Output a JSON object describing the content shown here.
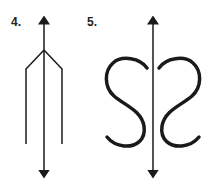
{
  "figures": [
    {
      "label": "4.",
      "description": "trident-shaped figure with vertical axis of symmetry (double-headed arrow)"
    },
    {
      "label": "5.",
      "description": "two mirrored S-curves with vertical axis of symmetry (double-headed arrow)"
    }
  ],
  "colors": {
    "stroke": "#1a1a1a",
    "background": "#ffffff"
  }
}
